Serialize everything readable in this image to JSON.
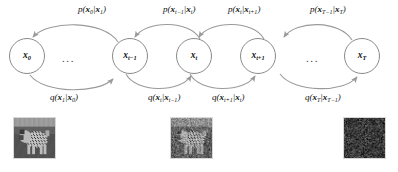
{
  "figure": {
    "background": "#ffffff",
    "node_stroke": "#8a8a8a",
    "arrow_color": "#9a9a9a",
    "text_color": "#111111"
  },
  "nodes": [
    {
      "id": "x0",
      "label": "x",
      "sub": "0",
      "cx": 27,
      "cy": 56,
      "r": 18
    },
    {
      "id": "xtm1",
      "label": "x",
      "sub": "t−1",
      "cx": 130,
      "cy": 56,
      "r": 18
    },
    {
      "id": "xt",
      "label": "x",
      "sub": "t",
      "cx": 194,
      "cy": 56,
      "r": 18
    },
    {
      "id": "xtp1",
      "label": "x",
      "sub": "t+1",
      "cx": 258,
      "cy": 56,
      "r": 18
    },
    {
      "id": "xT",
      "label": "x",
      "sub": "T",
      "cx": 362,
      "cy": 56,
      "r": 18
    }
  ],
  "ellipses": [
    {
      "id": "gap-left",
      "text": "...",
      "x": 66,
      "y": 58
    },
    {
      "id": "gap-right",
      "text": "...",
      "x": 310,
      "y": 58
    }
  ],
  "reverse_labels": [
    {
      "id": "p-x0-x1",
      "text": "p(x0|x1)",
      "head": "p(",
      "v1": "x",
      "s1": "0",
      "mid": "|",
      "v2": "x",
      "s2": "1",
      "tail": ")",
      "x": 78,
      "y": 6
    },
    {
      "id": "p-xtm1-xt",
      "text": "p(xt−1|xt)",
      "head": "p(",
      "v1": "x",
      "s1": "t−1",
      "mid": "|",
      "v2": "x",
      "s2": "t",
      "tail": ")",
      "x": 163,
      "y": 6
    },
    {
      "id": "p-xt-xtp1",
      "text": "p(xt|xt+1)",
      "head": "p(",
      "v1": "x",
      "s1": "t",
      "mid": "|",
      "v2": "x",
      "s2": "t+1",
      "tail": ")",
      "x": 228,
      "y": 6
    },
    {
      "id": "p-xTm1-xT",
      "text": "p(xT−1|xT)",
      "head": "p(",
      "v1": "x",
      "s1": "T−1",
      "mid": "|",
      "v2": "x",
      "s2": "T",
      "tail": ")",
      "x": 312,
      "y": 6
    }
  ],
  "forward_labels": [
    {
      "id": "q-x1-x0",
      "text": "q(x1|x0)",
      "head": "q(",
      "v1": "x",
      "s1": "1",
      "mid": "|",
      "v2": "x",
      "s2": "0",
      "tail": ")",
      "x": 50,
      "y": 94
    },
    {
      "id": "q-xt-xtm1",
      "text": "q(xt|xt−1)",
      "head": "q(",
      "v1": "x",
      "s1": "t",
      "mid": "|",
      "v2": "x",
      "s2": "t−1",
      "tail": ")",
      "x": 150,
      "y": 94
    },
    {
      "id": "q-xtp1-xt",
      "text": "q(xt+1|xt)",
      "head": "q(",
      "v1": "x",
      "s1": "t+1",
      "mid": "|",
      "v2": "x",
      "s2": "t",
      "tail": ")",
      "x": 213,
      "y": 94
    },
    {
      "id": "q-xT-xTm1",
      "text": "q(xT|xT−1)",
      "head": "q(",
      "v1": "x",
      "s1": "T",
      "mid": "|",
      "v2": "x",
      "s2": "T−1",
      "tail": ")",
      "x": 307,
      "y": 94
    }
  ],
  "thumbnails": [
    {
      "id": "thumb-x0",
      "kind": "photo-dog-clear",
      "x": 13,
      "y": 117,
      "w": 43,
      "h": 42,
      "noise": 0.0
    },
    {
      "id": "thumb-xt",
      "kind": "photo-dog-noisy",
      "x": 170,
      "y": 117,
      "w": 43,
      "h": 42,
      "noise": 0.55
    },
    {
      "id": "thumb-xT",
      "kind": "pure-noise",
      "x": 343,
      "y": 117,
      "w": 43,
      "h": 42,
      "noise": 1.0
    }
  ]
}
